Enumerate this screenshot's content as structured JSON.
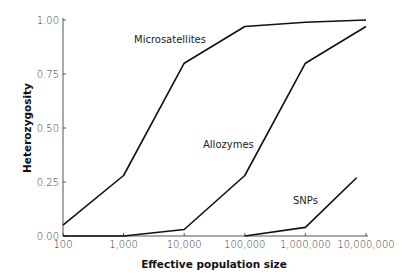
{
  "chart_data": {
    "type": "line",
    "title": "",
    "xlabel": "Effective population size",
    "ylabel": "Heterozygosity",
    "xscale": "log",
    "x_ticks": [
      100,
      1000,
      10000,
      100000,
      1000000,
      10000000
    ],
    "x_tick_labels": [
      "100",
      "1,000",
      "10,000",
      "100,000",
      "1,000,000",
      "10,000,000"
    ],
    "y_ticks": [
      0,
      0.25,
      0.5,
      0.75,
      1.0
    ],
    "y_tick_labels": [
      "0.00",
      "0.25",
      "0.50",
      "0.75",
      "1.00"
    ],
    "xlim": [
      100,
      10000000
    ],
    "ylim": [
      0,
      1.0
    ],
    "grid": false,
    "legend": "inline labels",
    "series": [
      {
        "name": "Microsatellites",
        "x": [
          100,
          1000,
          10000,
          100000,
          1000000,
          10000000
        ],
        "values": [
          0.05,
          0.28,
          0.8,
          0.97,
          0.99,
          1.0
        ]
      },
      {
        "name": "Allozymes",
        "x": [
          100,
          1000,
          10000,
          100000,
          1000000,
          10000000
        ],
        "values": [
          0.0,
          0.0,
          0.03,
          0.28,
          0.8,
          0.97
        ]
      },
      {
        "name": "SNPs",
        "x": [
          100000,
          1000000,
          7000000
        ],
        "values": [
          0.0,
          0.04,
          0.27
        ]
      }
    ]
  },
  "labels": {
    "microsatellites": "Microsatellites",
    "allozymes": "Allozymes",
    "snps": "SNPs",
    "xlabel": "Effective population size",
    "ylabel": "Heterozygosity"
  }
}
